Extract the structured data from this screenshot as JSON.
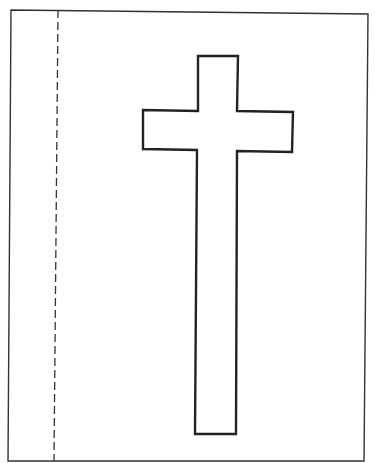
{
  "page": {
    "width": 375,
    "height": 463,
    "background": "#ffffff"
  },
  "frame": {
    "stroke": "#333333",
    "stroke_width": 1.4,
    "points": "11,10 368,14 364,461 8,461"
  },
  "fold_line": {
    "stroke": "#333333",
    "stroke_width": 1.3,
    "dasharray": "8 4",
    "x1": 58,
    "y1": 10,
    "x2": 54,
    "y2": 461
  },
  "cross": {
    "stroke": "#222222",
    "stroke_width": 2.4,
    "fill": "#ffffff",
    "points": "198,56 238,56 237,111 293,112 292,152 237,151 236,434 195,434 197,150 143,149 143,110 198,111"
  }
}
